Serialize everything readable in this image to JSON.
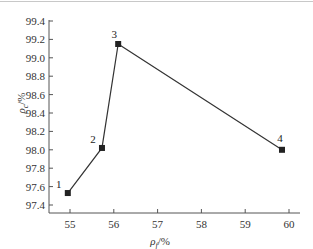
{
  "chart_data": {
    "type": "line",
    "title": "",
    "xlabel": "ρf/%",
    "ylabel": "ρc/%",
    "xlim": [
      54.55,
      60.2
    ],
    "ylim": [
      97.3,
      99.4
    ],
    "x_ticks": [
      55,
      56,
      57,
      58,
      59,
      60
    ],
    "y_ticks": [
      97.4,
      97.6,
      97.8,
      98.0,
      98.2,
      98.4,
      98.6,
      98.8,
      99.0,
      99.2,
      99.4
    ],
    "x_tick_labels": [
      "55",
      "56",
      "57",
      "58",
      "59",
      "60"
    ],
    "y_tick_labels": [
      "97.4",
      "97.6",
      "97.8",
      "98.0",
      "98.2",
      "98.4",
      "98.6",
      "98.8",
      "99.0",
      "99.2",
      "99.4"
    ],
    "grid": false,
    "legend": null,
    "series": [
      {
        "name": "ρc vs ρf",
        "marker": "square",
        "color": "#222222",
        "points": [
          {
            "label": "1",
            "x": 54.95,
            "y": 97.53
          },
          {
            "label": "2",
            "x": 55.73,
            "y": 98.02
          },
          {
            "label": "3",
            "x": 56.1,
            "y": 99.15
          },
          {
            "label": "4",
            "x": 59.84,
            "y": 98.0
          }
        ]
      }
    ]
  },
  "axes": {
    "x_title_main": "ρ",
    "x_title_sub": "f",
    "x_title_unit": "/%",
    "y_title_main": "ρ",
    "y_title_sub": "c",
    "y_title_unit": "/%"
  }
}
